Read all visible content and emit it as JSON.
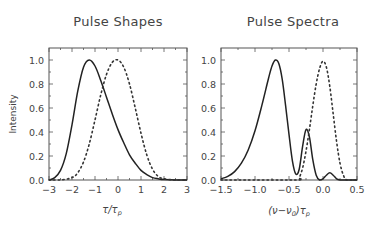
{
  "chart_data": [
    {
      "type": "line",
      "title": "Pulse Shapes",
      "xlabel": "τ/τp",
      "ylabel": "Intensity",
      "xlim": [
        -3,
        3
      ],
      "ylim": [
        0,
        1.1
      ],
      "xticks": [
        -3,
        -2,
        -1,
        0,
        1,
        2,
        3
      ],
      "xtick_labels": [
        "−3",
        "−2",
        "−1",
        "0",
        "1",
        "2",
        "3"
      ],
      "yticks": [
        0.0,
        0.2,
        0.4,
        0.6,
        0.8,
        1.0
      ],
      "ytick_labels": [
        "0.0",
        "0.2",
        "0.4",
        "0.6",
        "0.8",
        "1.0"
      ],
      "grid": false,
      "series": [
        {
          "name": "solid",
          "style": "solid",
          "x": [
            -3.0,
            -2.75,
            -2.5,
            -2.25,
            -2.0,
            -1.75,
            -1.5,
            -1.25,
            -1.0,
            -0.75,
            -0.5,
            -0.25,
            0.0,
            0.25,
            0.5,
            0.75,
            1.0,
            1.25,
            1.5,
            1.75,
            2.0,
            2.5,
            3.0
          ],
          "y": [
            0.0,
            0.02,
            0.08,
            0.22,
            0.46,
            0.74,
            0.94,
            1.0,
            0.95,
            0.83,
            0.69,
            0.55,
            0.42,
            0.31,
            0.21,
            0.14,
            0.08,
            0.045,
            0.02,
            0.01,
            0.004,
            0.0,
            0.0
          ]
        },
        {
          "name": "dotted",
          "style": "dotted",
          "x": [
            -3.0,
            -2.5,
            -2.0,
            -1.75,
            -1.5,
            -1.25,
            -1.0,
            -0.75,
            -0.5,
            -0.25,
            0.0,
            0.25,
            0.5,
            0.75,
            1.0,
            1.25,
            1.5,
            1.75,
            2.0,
            2.5,
            3.0
          ],
          "y": [
            0.0,
            0.0,
            0.02,
            0.06,
            0.15,
            0.3,
            0.5,
            0.71,
            0.88,
            0.98,
            1.0,
            0.94,
            0.8,
            0.6,
            0.39,
            0.21,
            0.09,
            0.03,
            0.01,
            0.0,
            0.0
          ]
        }
      ]
    },
    {
      "type": "line",
      "title": "Pulse Spectra",
      "xlabel": "(ν−ν0)τp",
      "ylabel": "",
      "xlim": [
        -1.5,
        0.5
      ],
      "ylim": [
        0,
        1.1
      ],
      "xticks": [
        -1.5,
        -1.0,
        -0.5,
        0.0,
        0.5
      ],
      "xtick_labels": [
        "−1.5",
        "−1.0",
        "−0.5",
        "0.0",
        "0.5"
      ],
      "yticks": [
        0.0,
        0.2,
        0.4,
        0.6,
        0.8,
        1.0
      ],
      "ytick_labels": [
        "0.0",
        "0.2",
        "0.4",
        "0.6",
        "0.8",
        "1.0"
      ],
      "grid": false,
      "series": [
        {
          "name": "solid",
          "style": "solid",
          "x": [
            -1.5,
            -1.4,
            -1.3,
            -1.2,
            -1.1,
            -1.0,
            -0.9,
            -0.8,
            -0.75,
            -0.7,
            -0.65,
            -0.6,
            -0.55,
            -0.5,
            -0.45,
            -0.4,
            -0.35,
            -0.3,
            -0.25,
            -0.2,
            -0.15,
            -0.1,
            -0.05,
            0.0,
            0.05,
            0.1,
            0.15,
            0.2,
            0.25,
            0.3,
            0.5
          ],
          "y": [
            0.01,
            0.03,
            0.07,
            0.14,
            0.25,
            0.41,
            0.62,
            0.85,
            0.95,
            1.0,
            0.97,
            0.84,
            0.62,
            0.38,
            0.16,
            0.05,
            0.09,
            0.28,
            0.42,
            0.36,
            0.17,
            0.04,
            0.0,
            0.01,
            0.04,
            0.06,
            0.04,
            0.01,
            0.0,
            0.0,
            0.0
          ]
        },
        {
          "name": "dotted",
          "style": "dotted",
          "x": [
            -1.5,
            -0.4,
            -0.35,
            -0.3,
            -0.25,
            -0.2,
            -0.15,
            -0.1,
            -0.05,
            0.0,
            0.05,
            0.1,
            0.15,
            0.2,
            0.25,
            0.3,
            0.35,
            0.5
          ],
          "y": [
            0.0,
            0.0,
            0.02,
            0.1,
            0.24,
            0.42,
            0.62,
            0.8,
            0.93,
            0.99,
            0.94,
            0.78,
            0.55,
            0.32,
            0.14,
            0.04,
            0.0,
            0.0
          ]
        }
      ]
    }
  ],
  "panels": [
    {
      "title": "Pulse Shapes",
      "xlabel_main": "τ/τ",
      "xlabel_sub": "p",
      "ylabel": "Intensity"
    },
    {
      "title": "Pulse Spectra",
      "xlabel_main": "(ν−ν",
      "xlabel_sub0": "0",
      "xlabel_mid": ")τ",
      "xlabel_sub": "p"
    }
  ]
}
